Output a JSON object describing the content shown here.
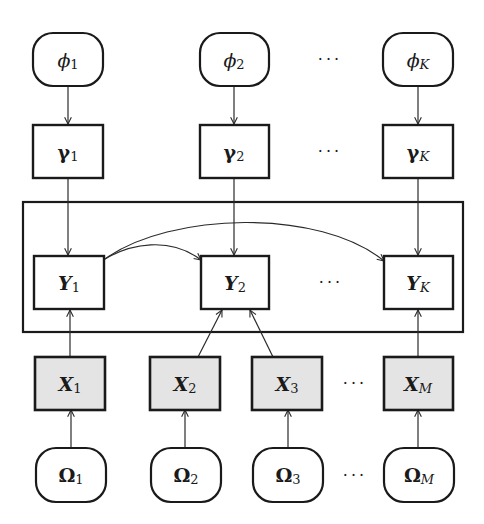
{
  "diagram": {
    "type": "graphical-model",
    "background": "#ffffff",
    "observed_fill": "#e4e4e4",
    "ellipsis": "···",
    "rows": {
      "phi": [
        {
          "id": "phi_1",
          "base": "ϕ",
          "sub": "1"
        },
        {
          "id": "phi_2",
          "base": "ϕ",
          "sub": "2"
        },
        {
          "id": "phi_K",
          "base": "ϕ",
          "sub": "K"
        }
      ],
      "gamma": [
        {
          "id": "gamma_1",
          "base": "γ",
          "sub": "1"
        },
        {
          "id": "gamma_2",
          "base": "γ",
          "sub": "2"
        },
        {
          "id": "gamma_K",
          "base": "γ",
          "sub": "K"
        }
      ],
      "Y": [
        {
          "id": "Y_1",
          "base": "Y",
          "sub": "1"
        },
        {
          "id": "Y_2",
          "base": "Y",
          "sub": "2"
        },
        {
          "id": "Y_K",
          "base": "Y",
          "sub": "K"
        }
      ],
      "X": [
        {
          "id": "X_1",
          "base": "X",
          "sub": "1",
          "observed": true
        },
        {
          "id": "X_2",
          "base": "X",
          "sub": "2",
          "observed": true
        },
        {
          "id": "X_3",
          "base": "X",
          "sub": "3",
          "observed": true
        },
        {
          "id": "X_M",
          "base": "X",
          "sub": "M",
          "observed": true
        }
      ],
      "Omega": [
        {
          "id": "Omega_1",
          "base": "Ω",
          "sub": "1"
        },
        {
          "id": "Omega_2",
          "base": "Ω",
          "sub": "2"
        },
        {
          "id": "Omega_3",
          "base": "Ω",
          "sub": "3"
        },
        {
          "id": "Omega_M",
          "base": "Ω",
          "sub": "M"
        }
      ]
    },
    "edges": [
      {
        "from": "phi_1",
        "to": "gamma_1"
      },
      {
        "from": "phi_2",
        "to": "gamma_2"
      },
      {
        "from": "phi_K",
        "to": "gamma_K"
      },
      {
        "from": "gamma_1",
        "to": "Y_1"
      },
      {
        "from": "gamma_2",
        "to": "Y_2"
      },
      {
        "from": "gamma_K",
        "to": "Y_K"
      },
      {
        "from": "Y_1",
        "to": "Y_2",
        "curved": true
      },
      {
        "from": "Y_1",
        "to": "Y_K",
        "curved": true
      },
      {
        "from": "X_1",
        "to": "Y_1"
      },
      {
        "from": "X_2",
        "to": "Y_2"
      },
      {
        "from": "X_3",
        "to": "Y_2"
      },
      {
        "from": "X_M",
        "to": "Y_K"
      },
      {
        "from": "Omega_1",
        "to": "X_1"
      },
      {
        "from": "Omega_2",
        "to": "X_2"
      },
      {
        "from": "Omega_3",
        "to": "X_3"
      },
      {
        "from": "Omega_M",
        "to": "X_M"
      }
    ]
  }
}
